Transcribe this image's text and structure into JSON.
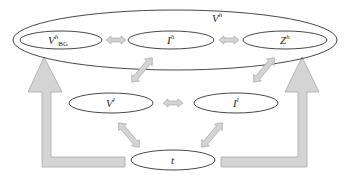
{
  "diagram": {
    "outer_group": {
      "label": "V",
      "sup": "h"
    },
    "nodes": [
      {
        "id": "vbg",
        "label": "V",
        "sup": "h",
        "sub": "BG"
      },
      {
        "id": "ih",
        "label": "I",
        "sup": "h"
      },
      {
        "id": "zh",
        "label": "Z",
        "sup": "h"
      },
      {
        "id": "vl",
        "label": "V",
        "sup": "l"
      },
      {
        "id": "il",
        "label": "I",
        "sup": "l"
      },
      {
        "id": "t",
        "label": "t"
      }
    ],
    "edges": [
      {
        "from": "vbg",
        "to": "ih",
        "type": "bidirectional"
      },
      {
        "from": "ih",
        "to": "zh",
        "type": "bidirectional"
      },
      {
        "from": "ih",
        "to": "vl",
        "type": "bidirectional"
      },
      {
        "from": "zh",
        "to": "il",
        "type": "bidirectional"
      },
      {
        "from": "vl",
        "to": "il",
        "type": "bidirectional"
      },
      {
        "from": "vl",
        "to": "t",
        "type": "bidirectional"
      },
      {
        "from": "il",
        "to": "t",
        "type": "bidirectional"
      },
      {
        "from": "t",
        "to": "outer_group_left",
        "type": "large-elbow"
      },
      {
        "from": "t",
        "to": "outer_group_right",
        "type": "large-elbow"
      }
    ],
    "colors": {
      "stroke": "#333333",
      "arrow_fill": "#d4d4d4",
      "arrow_stroke": "#a8a8a8"
    }
  }
}
